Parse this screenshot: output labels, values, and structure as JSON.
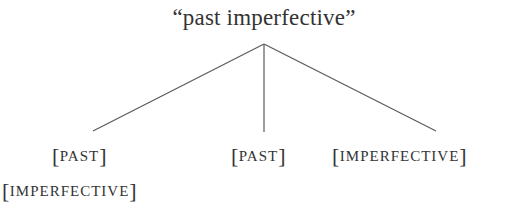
{
  "diagram": {
    "type": "feature-tree",
    "root": {
      "label": "“past imperfective”"
    },
    "branches": [
      {
        "id": "left",
        "features": [
          {
            "open": "[",
            "text": "PAST",
            "close": "]"
          },
          {
            "open": "[",
            "text": "IMPERFECTIVE",
            "close": "]"
          }
        ]
      },
      {
        "id": "middle",
        "features": [
          {
            "open": "[",
            "text": "PAST",
            "close": "]"
          }
        ]
      },
      {
        "id": "right",
        "features": [
          {
            "open": "[",
            "text": "IMPERFECTIVE",
            "close": "]"
          }
        ]
      }
    ],
    "colors": {
      "text": "#333333",
      "lines": "#5a5a5a",
      "background": "#ffffff"
    }
  }
}
